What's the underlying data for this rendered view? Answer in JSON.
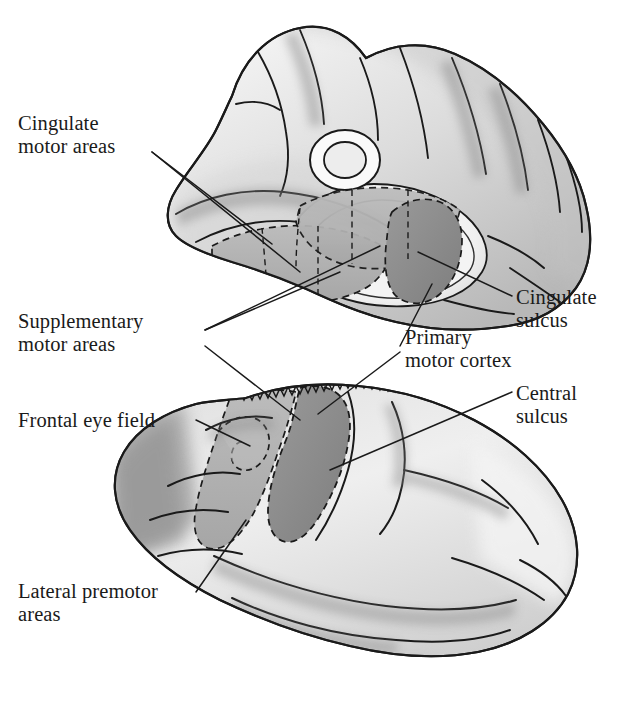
{
  "figure": {
    "kind": "anatomical-illustration",
    "background_color": "#ffffff",
    "ink_color": "#1a1a1a",
    "views": [
      {
        "name": "medial-view",
        "position": "top",
        "description": "Medial surface of the cerebral hemisphere"
      },
      {
        "name": "lateral-view",
        "position": "bottom",
        "description": "Lateral surface of the cerebral hemisphere"
      }
    ]
  },
  "labels": {
    "cingulate_motor_areas": "Cingulate\nmotor areas",
    "supplementary_motor_areas": "Supplementary\nmotor areas",
    "frontal_eye_field": "Frontal eye field",
    "lateral_premotor_areas": "Lateral premotor\nareas",
    "cingulate_sulcus": "Cingulate\nsulcus",
    "primary_motor_cortex": "Primary\nmotor cortex",
    "central_sulcus": "Central\nsulcus"
  },
  "shading": {
    "cortex_light": "#e6e6e6",
    "cortex_mid": "#c9c9c9",
    "region_mid_gray": "#b2b2b2",
    "region_dark_gray": "#8f8f8f",
    "region_darkest": "#7c7c7c",
    "outline": "#1a1a1a",
    "white_matter": "#fbfbfb"
  },
  "leader_lines": {
    "style": "thin solid black",
    "cingulate_motor_areas_count": 2,
    "supplementary_motor_areas_count": 3,
    "primary_motor_cortex_count": 2,
    "frontal_eye_field_count": 1,
    "lateral_premotor_areas_count": 1,
    "cingulate_sulcus_count": 1,
    "central_sulcus_count": 1
  }
}
